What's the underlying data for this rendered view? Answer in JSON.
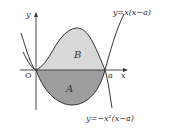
{
  "diagram": {
    "axis_labels": {
      "y": "y",
      "x": "x",
      "origin": "O",
      "a": "a"
    },
    "regions": {
      "upper": "B",
      "lower": "A"
    },
    "curves": {
      "parabola": "y=x(x−a)",
      "cubic_eq": "y=−x²(x−a)"
    },
    "colors": {
      "region_B": "#d8d8d8",
      "region_A": "#9e9e9e",
      "stroke": "#333333"
    }
  }
}
